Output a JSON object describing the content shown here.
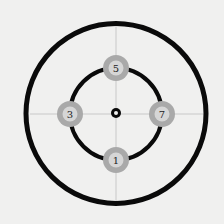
{
  "diagram": {
    "background": "#f0f0ef",
    "center": {
      "x": 116,
      "y": 113
    },
    "outer_ring": {
      "radius": 90,
      "stroke": "#0a0a0a",
      "stroke_width": 5
    },
    "inner_ring": {
      "radius": 46,
      "stroke": "#0a0a0a",
      "stroke_width": 4
    },
    "center_dot": {
      "outer_radius": 5,
      "inner_radius": 2
    },
    "crosshair_color": "#c8c8c8",
    "nodes": [
      {
        "label": "5",
        "position": "top",
        "x": 116,
        "y": 68
      },
      {
        "label": "3",
        "position": "left",
        "x": 70,
        "y": 114
      },
      {
        "label": "7",
        "position": "right",
        "x": 162,
        "y": 114
      },
      {
        "label": "1",
        "position": "bottom",
        "x": 116,
        "y": 160
      }
    ],
    "node_style": {
      "outer_fill": "#a9a9a9",
      "inner_fill": "#d6d6d6",
      "outer_radius": 13,
      "inner_radius": 7
    }
  }
}
